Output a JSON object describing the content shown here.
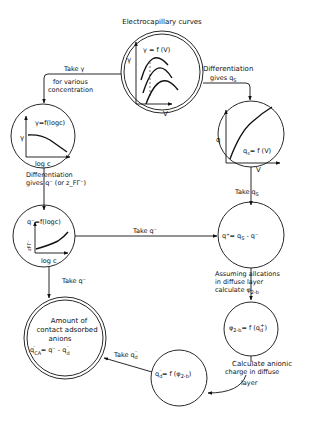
{
  "title": "Electrocapillary curves",
  "nodes": {
    "electrocapillary": {
      "label": "Electrocapillary curves",
      "equation": "γ = f (V)",
      "y_axis": "γ",
      "x_axis": "V"
    },
    "gamma_logc": {
      "equation": "γ=f(logc)",
      "y_axis": "γ",
      "x_axis": "log c"
    },
    "qs_v": {
      "equation": "q",
      "equation_sub": "s",
      "equation_rest": "= f (V)",
      "y_axis": "q",
      "x_axis": "V"
    },
    "qminus_logc": {
      "equation": "q⁻=f(logc)",
      "y_axis": "zFΓ⁻",
      "x_axis": "log c"
    },
    "qplus": {
      "equation": "q⁺= q",
      "equation_sub": "S",
      "equation_rest": " - q⁻"
    },
    "phi": {
      "equation": "φ",
      "equation_sub": "2-b",
      "equation_rest": "= f (q",
      "equation_rest_sub": "d",
      "equation_rest_sup": "+",
      "equation_close": ")"
    },
    "qd": {
      "equation": "q",
      "equation_sub": "d",
      "equation_sup": "⁻",
      "equation_rest": "= f (φ",
      "equation_rest_sub": "2-b",
      "equation_close": ")"
    },
    "contact": {
      "lines": [
        "Amount of",
        "contact adsorbed",
        "anions"
      ],
      "equation": "q",
      "equation_sub": "CA",
      "equation_sup": "⁻",
      "equation_rest": "= q⁻ - q",
      "equation_rest_sub": "d",
      "equation_rest_sup": "⁻"
    }
  },
  "edges": {
    "take_gamma": {
      "line1": "Take γ",
      "line2": "for various",
      "line3": "concentration"
    },
    "differentiation_qs": {
      "line1": "Differentiation",
      "line2": "gives q",
      "line2_sub": "S"
    },
    "differentiation_qminus": {
      "line1": "Differentiation",
      "line2": "gives q⁻ (or z_FΓ⁻)"
    },
    "take_qs": {
      "label": "Take q",
      "label_sub": "S"
    },
    "take_qminus_right": {
      "label": "Take q⁻"
    },
    "take_qminus_down": {
      "label": "Take q⁻"
    },
    "assuming": {
      "line1": "Assuming allcations",
      "line2": "in diffuse layer",
      "line3": "calculate φ",
      "line3_sub": "2-b"
    },
    "calc_anionic": {
      "line1": "Calculate anionic",
      "line2": "charge in diffuse",
      "line3": "layer"
    },
    "take_qd": {
      "label": "Take q",
      "label_sub": "d",
      "label_sup": "⁻"
    }
  }
}
